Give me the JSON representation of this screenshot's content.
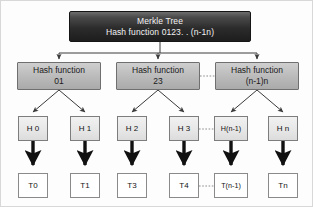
{
  "diagram": {
    "title": "Merkle Tree",
    "root": {
      "line1": "Merkle Tree",
      "line2": "Hash function 0123. . (n-1n)"
    },
    "hash_nodes": [
      {
        "line1": "Hash function",
        "line2": "01"
      },
      {
        "line1": "Hash function",
        "line2": "23"
      },
      {
        "line1": "Hash function",
        "line2": "(n-1)n"
      }
    ],
    "hash_leaves": [
      {
        "label": "H 0"
      },
      {
        "label": "H 1"
      },
      {
        "label": "H 2"
      },
      {
        "label": "H 3"
      },
      {
        "label": "H(n-1)"
      },
      {
        "label": "H n"
      }
    ],
    "transactions": [
      {
        "label": "T0"
      },
      {
        "label": "T1"
      },
      {
        "label": "T3"
      },
      {
        "label": "T4"
      },
      {
        "label": "T(n-1)"
      },
      {
        "label": "Tn"
      }
    ],
    "colors": {
      "root_fill_dark": "#1d1d1d",
      "root_fill_light": "#6d6d6d",
      "root_text": "#f2f2f2",
      "hash_fill": "#bdbdbd",
      "hash_border": "#6f6f6f",
      "leaf_hash_fill": "#e6e6e6",
      "transaction_fill": "#ffffff",
      "connector": "#3a3a3a",
      "thick_arrow": "#111111",
      "dotted_connector": "#8d8d8d",
      "canvas_background": "#fdfdfd",
      "canvas_border": "#d8d8d8"
    }
  }
}
